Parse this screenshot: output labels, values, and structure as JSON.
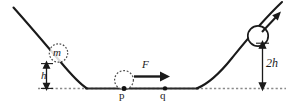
{
  "figure": {
    "background_color": "#ffffff",
    "stroke_color": "#1a1a1a",
    "labels": {
      "mass": "m",
      "height_left": "h",
      "height_right": "2h",
      "force": "F",
      "point_p": "p",
      "point_q": "q"
    },
    "icons": {
      "mass_circle": "dashed-circle-icon",
      "pushed_ball": "dashed-circle-icon",
      "launched_ball": "solid-circle-icon",
      "force_arrow": "right-arrow-icon",
      "velocity_arrow": "diagonal-up-right-arrow-icon",
      "height_dimension": "double-headed-vertical-arrow-icon"
    },
    "elements": {
      "track_label": "parabolic track",
      "baseline_label": "ground reference line",
      "segment_pq_label": "flat segment between p and q"
    }
  }
}
